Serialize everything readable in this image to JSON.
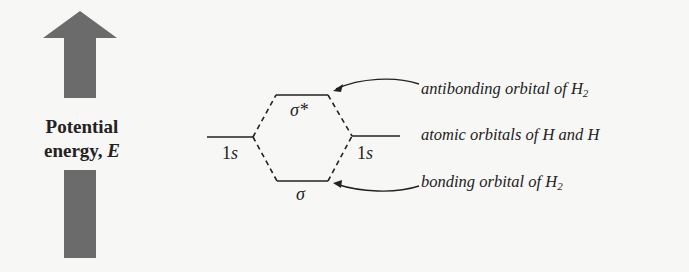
{
  "axis": {
    "label_line1": "Potential",
    "label_line2": "energy,",
    "label_var": "E",
    "arrow_color": "#6b6b6b",
    "direction": "up"
  },
  "orbitals": {
    "left_atomic": {
      "label_num": "1",
      "label_sub": "s"
    },
    "right_atomic": {
      "label_num": "1",
      "label_sub": "s"
    },
    "antibonding": {
      "label": "σ*"
    },
    "bonding": {
      "label": "σ"
    }
  },
  "annotations": {
    "antibonding": {
      "text": "antibonding orbital of H",
      "sub": "2"
    },
    "atomic": {
      "text": "atomic orbitals of H and H"
    },
    "bonding": {
      "text": "bonding orbital of H",
      "sub": "2"
    }
  }
}
